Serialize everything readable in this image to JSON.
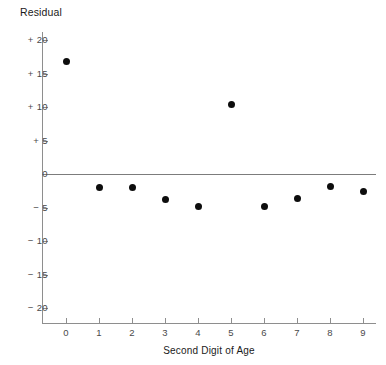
{
  "chart_data": {
    "type": "scatter",
    "title": "",
    "xlabel": "Second Digit of Age",
    "ylabel": "Residual",
    "x": [
      0,
      1,
      2,
      3,
      4,
      5,
      6,
      7,
      8,
      9
    ],
    "values": [
      16.8,
      -2.0,
      -2.0,
      -3.8,
      -4.8,
      10.3,
      -4.8,
      -3.7,
      -1.8,
      -2.6
    ],
    "categories": [
      "0",
      "1",
      "2",
      "3",
      "4",
      "5",
      "6",
      "7",
      "8",
      "9"
    ],
    "xtick_labels": [
      "0",
      "1",
      "2",
      "3",
      "4",
      "5",
      "6",
      "7",
      "8",
      "9"
    ],
    "ytick_labels": [
      "+ 20",
      "+ 15",
      "+ 10",
      "+ 5",
      "0",
      "− 5",
      "− 10",
      "− 15",
      "− 20"
    ],
    "ytick_values": [
      20,
      15,
      10,
      5,
      0,
      -5,
      -10,
      -15,
      -20
    ],
    "ylim": [
      -22,
      22
    ],
    "xlim": [
      -0.75,
      9.4
    ],
    "grid": false,
    "legend": null,
    "reference_line": {
      "y": 0,
      "color": "#7c7c7c"
    },
    "marker_color": "#0d0d0d",
    "axis_color": "#8e8e8e",
    "background": "#ffffff"
  }
}
